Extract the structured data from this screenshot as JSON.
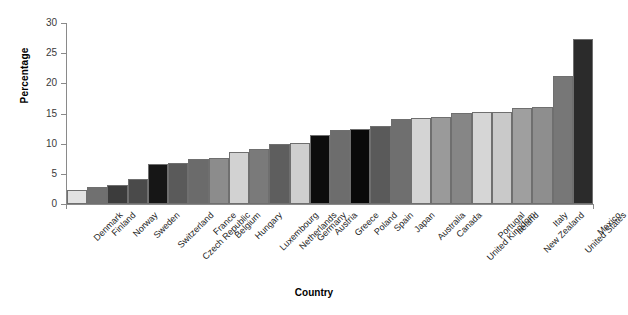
{
  "chart_data": {
    "type": "bar",
    "title": "",
    "xlabel": "Country",
    "ylabel": "Percentage",
    "ylim": [
      0,
      30
    ],
    "yticks": [
      0,
      5,
      10,
      15,
      20,
      25,
      30
    ],
    "grid": false,
    "legend": "none",
    "categories": [
      "Denmark",
      "Finland",
      "Norway",
      "Sweden",
      "Switzerland",
      "Czech Republic",
      "France",
      "Belgium",
      "Hungary",
      "Luxembourg",
      "Netherlands",
      "Germany",
      "Austria",
      "Greece",
      "Poland",
      "Spain",
      "Japan",
      "Australia",
      "Canada",
      "United Kingdom",
      "Portugal",
      "Ireland",
      "New Zealand",
      "Italy",
      "United States",
      "Mexico"
    ],
    "values": [
      2.3,
      2.8,
      3.1,
      4.1,
      6.6,
      6.8,
      7.4,
      7.6,
      8.7,
      9.2,
      10.0,
      10.1,
      11.5,
      12.3,
      12.4,
      12.9,
      14.1,
      14.3,
      14.5,
      15.1,
      15.2,
      15.3,
      15.9,
      16.1,
      21.3,
      27.4
    ],
    "bar_colors": [
      "#e2e2e2",
      "#707070",
      "#3c3c3c",
      "#4a4a4a",
      "#161616",
      "#5a5a5a",
      "#6b6b6b",
      "#8c8c8c",
      "#d2d2d2",
      "#7a7a7a",
      "#5e5e5e",
      "#cfcfcf",
      "#0c0c0c",
      "#6d6d6d",
      "#0a0a0a",
      "#5a5a5a",
      "#6f6f6f",
      "#d4d4d4",
      "#9a9a9a",
      "#868686",
      "#d6d6d6",
      "#c9c9c9",
      "#9f9f9f",
      "#8e8e8e",
      "#777777",
      "#2b2b2b"
    ],
    "bar_edge_color": "#6f6f6f"
  }
}
